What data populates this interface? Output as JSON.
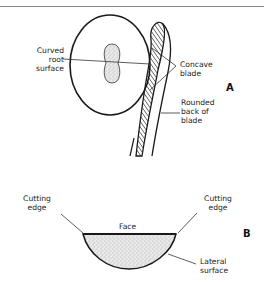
{
  "figure": {
    "panel_a": {
      "letter": "A",
      "labels": {
        "curved_root_surface": [
          "Curved",
          "root",
          "surface"
        ],
        "concave_blade": [
          "Concave",
          "blade"
        ],
        "rounded_back_of_blade": [
          "Rounded",
          "back of",
          "blade"
        ]
      }
    },
    "panel_b": {
      "letter": "B",
      "labels": {
        "cutting_edge_left": [
          "Cutting",
          "edge"
        ],
        "cutting_edge_right": [
          "Cutting",
          "edge"
        ],
        "face": "Face",
        "lateral_surface": [
          "Lateral",
          "surface"
        ]
      }
    }
  },
  "colors": {
    "ink": "#1a1a1a",
    "rule": "#8a8a8a",
    "stipple_fill": "#e6e6e6"
  }
}
